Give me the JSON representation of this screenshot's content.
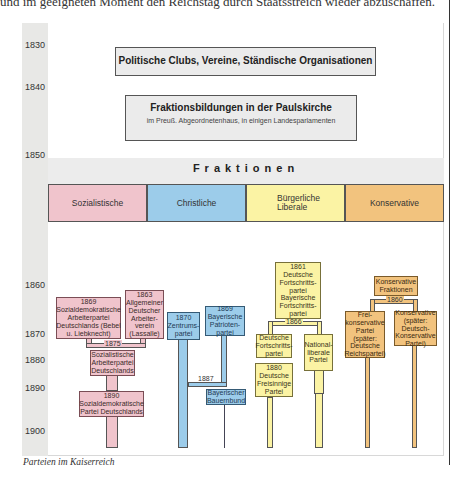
{
  "page": {
    "top_text": "und im geeigneten Moment den Reichstag durch Staatsstreich wieder abzuschaffen.",
    "caption": "Parteien im Kaiserreich"
  },
  "timeline": {
    "years": [
      "1830",
      "1840",
      "1850",
      "1860",
      "1870",
      "1880",
      "1890",
      "1900"
    ]
  },
  "early": {
    "clubs": "Politische Clubs, Vereine, Ständische Organisationen",
    "paulskirche_title": "Fraktionsbildungen in der Paulskirche",
    "paulskirche_sub": "im Preuß. Abgeordnetenhaus, in einigen Landesparlamenten"
  },
  "fraktionen": {
    "title": "Fraktionen",
    "categories": [
      {
        "label": "Sozialistische",
        "color": "#f0c4cc"
      },
      {
        "label": "Christliche",
        "color": "#9cccea"
      },
      {
        "label": "Bürgerliche Liberale",
        "color": "#fbf3a4"
      },
      {
        "label": "Konservative",
        "color": "#f2c37e"
      }
    ]
  },
  "parties": {
    "sdap": "1869 Sozialdemokratische Arbeiterpartei Deutschlands (Bebel u. Liebknecht)",
    "adav": "1863 Allgemeiner Deutscher Arbeiter-verein (Lassalle)",
    "merge_1875": "1875",
    "sap": "Sozialistische Arbeiterpartei Deutschlands",
    "spd": "1890 Sozialdemokratische Partei Deutschlands",
    "zentrum": "1870 Zentrums-partei",
    "bay_patrioten": "1869 Bayerische Patrioten-partei",
    "split_1887": "1887",
    "bay_bauernbund": "Bayerischer Bauernbund",
    "fortschritt_1861": "1861 Deutsche Fortschritts-partei Bayerische Fortschritts-partei",
    "split_1866": "1866",
    "dfp": "Deutsche Fortschritts-partei",
    "nationalliberal": "National-liberale Partei",
    "freisinn": "1880 Deutsche Freisinnige Partei",
    "kons_fraktionen": "Konservative Fraktionen",
    "split_1860": "1860",
    "freikons": "Frei-konservative Partei (später: Deutsche Reichspartei)",
    "kons_partei": "Konservative (später: Deutsch-Konservative Partei)"
  }
}
